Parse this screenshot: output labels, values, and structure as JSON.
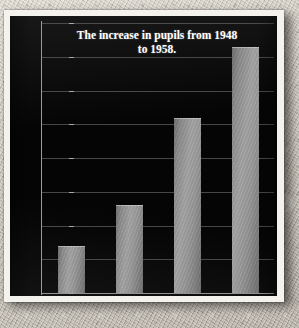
{
  "chart_data": {
    "type": "bar",
    "title": "The increase in pupils from 1948 to 1958.",
    "title_line1": "The increase in pupils from 1948",
    "title_line2": "to 1958.",
    "categories": [
      "Year 1948",
      "Year 1952",
      "Year 1956",
      "Year 1958"
    ],
    "values": [
      14,
      26,
      52,
      73
    ],
    "xlabel": "",
    "ylabel": "",
    "ylim": [
      0,
      80
    ],
    "ytick_step": 10,
    "yticks": [
      0,
      10,
      20,
      30,
      40,
      50,
      60,
      70,
      80
    ],
    "ytick_labels": [
      "0",
      "10",
      "20",
      "30",
      "40",
      "50",
      "60",
      "70",
      "80"
    ],
    "grid": true,
    "legend": false,
    "legend_position": "none",
    "series": [
      {
        "name": "Pupils",
        "values": [
          14,
          26,
          52,
          73
        ]
      }
    ]
  },
  "style": {
    "plot_background": "#050505",
    "frame_color": "#f4f2ec",
    "bar_color": "#a5a5a5",
    "bar_color_dark": "#6f6f6f",
    "gridline_color": "#5d5d5d",
    "axis_color": "#9a9a9a",
    "title_color": "#ffffff",
    "tick_label_color": "#c9c9c9",
    "page_background": "#c6c0b4"
  }
}
